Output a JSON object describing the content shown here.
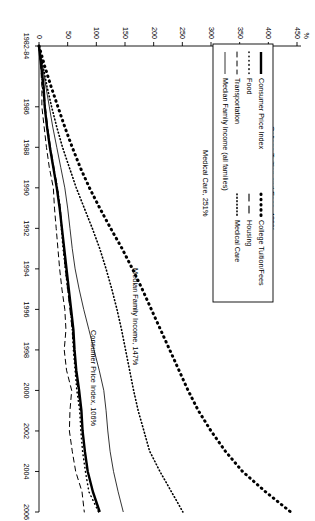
{
  "figure": {
    "orientation": "rotated-90-clockwise",
    "background_color": "#ffffff",
    "ink_color": "#000000"
  },
  "axes": {
    "y_unit_label": "%",
    "y_ticks": [
      "0",
      "50",
      "100",
      "150",
      "200",
      "250",
      "300",
      "350",
      "400",
      "450"
    ],
    "x_ticks": [
      "1982-84",
      "1986",
      "1988",
      "1990",
      "1992",
      "1994",
      "1996",
      "1998",
      "2000",
      "2002",
      "2004",
      "2006"
    ]
  },
  "legend": {
    "column_one": [
      {
        "label": "Consumer Price Index",
        "style": "solid-thick"
      },
      {
        "label": "Food",
        "style": "dotted"
      },
      {
        "label": "Transportation",
        "style": "dashed"
      },
      {
        "label": "Median Family Income (all families)",
        "style": "solid-thin"
      }
    ],
    "column_two": [
      {
        "label": "College Tuition/Fees",
        "style": "fine-dotted"
      },
      {
        "label": "Housing",
        "style": "long-dashed"
      },
      {
        "label": "Medical Care",
        "style": "dense-dotted"
      }
    ]
  },
  "annotations": [
    {
      "name": "college-tuition-annotation",
      "text": "College Tuition and Fees, 439%"
    },
    {
      "name": "medical-care-annotation",
      "text": "Medical Care, 251%"
    },
    {
      "name": "median-family-income-annotation",
      "text": "Median Family Income, 147%"
    },
    {
      "name": "consumer-price-index-annotation",
      "text": "Consumer Price Index, 106%"
    }
  ],
  "chart_data": {
    "type": "line",
    "title": "",
    "subtitle": "",
    "xlabel": "",
    "ylabel": "%",
    "xlim": [
      "1982-84",
      "2006"
    ],
    "ylim": [
      0,
      450
    ],
    "grid": false,
    "legend_position": "upper-left",
    "x": [
      1983,
      1984,
      1985,
      1986,
      1987,
      1988,
      1989,
      1990,
      1991,
      1992,
      1993,
      1994,
      1995,
      1996,
      1997,
      1998,
      1999,
      2000,
      2001,
      2002,
      2003,
      2004,
      2005,
      2006
    ],
    "x_tick_values": [
      1983,
      1986,
      1988,
      1990,
      1992,
      1994,
      1996,
      1998,
      2000,
      2002,
      2004,
      2006
    ],
    "series": [
      {
        "name": "College Tuition/Fees",
        "style": "fine-dotted",
        "end_value": 439,
        "values": [
          0,
          10,
          21,
          33,
          45,
          58,
          72,
          88,
          106,
          125,
          145,
          163,
          180,
          196,
          212,
          228,
          244,
          260,
          278,
          300,
          325,
          355,
          395,
          439
        ]
      },
      {
        "name": "Medical Care",
        "style": "dense-dotted",
        "end_value": 251,
        "values": [
          0,
          7,
          14,
          22,
          31,
          41,
          53,
          65,
          79,
          93,
          106,
          117,
          127,
          136,
          144,
          151,
          158,
          165,
          173,
          183,
          193,
          211,
          231,
          251
        ]
      },
      {
        "name": "Median Family Income (all families)",
        "style": "solid-thin",
        "end_value": 147,
        "values": [
          0,
          6,
          12,
          18,
          24,
          31,
          38,
          45,
          50,
          54,
          58,
          63,
          70,
          78,
          87,
          96,
          105,
          113,
          117,
          120,
          124,
          130,
          138,
          147
        ]
      },
      {
        "name": "Consumer Price Index",
        "style": "solid-thick",
        "end_value": 106,
        "values": [
          0,
          4,
          8,
          10,
          14,
          19,
          25,
          31,
          36,
          40,
          44,
          48,
          52,
          56,
          60,
          62,
          65,
          70,
          74,
          76,
          80,
          85,
          94,
          106
        ]
      },
      {
        "name": "Food",
        "style": "dotted",
        "end_value": 104,
        "values": [
          0,
          4,
          6,
          10,
          14,
          19,
          25,
          32,
          37,
          39,
          42,
          46,
          50,
          55,
          58,
          60,
          63,
          66,
          71,
          73,
          76,
          81,
          87,
          104
        ]
      },
      {
        "name": "Housing",
        "style": "long-dashed",
        "end_value": 104,
        "values": [
          0,
          4,
          8,
          11,
          15,
          20,
          26,
          32,
          37,
          40,
          43,
          46,
          50,
          54,
          58,
          61,
          64,
          68,
          73,
          76,
          80,
          85,
          94,
          104
        ]
      },
      {
        "name": "Transportation",
        "style": "dashed",
        "end_value": 79,
        "values": [
          0,
          3,
          5,
          5,
          9,
          13,
          18,
          25,
          27,
          30,
          33,
          36,
          40,
          45,
          47,
          44,
          48,
          57,
          54,
          53,
          58,
          64,
          75,
          79
        ]
      }
    ]
  }
}
